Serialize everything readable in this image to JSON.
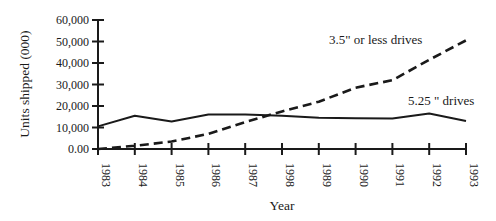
{
  "chart_data": {
    "type": "line",
    "title": "",
    "xlabel": "Year",
    "ylabel": "Units shipped (000)",
    "ylim": [
      0,
      60000
    ],
    "grid": false,
    "legend_position": "inline annotations",
    "x": [
      "1983",
      "1984",
      "1985",
      "1986",
      "1987",
      "1998",
      "1989",
      "1990",
      "1991",
      "1992",
      "1993"
    ],
    "y_ticks": [
      "0.00",
      "10,000",
      "20,000",
      "30,000",
      "40,000",
      "50,000",
      "60,000"
    ],
    "y_tick_values": [
      0,
      10000,
      20000,
      30000,
      40000,
      50000,
      60000
    ],
    "series": [
      {
        "name": "3.5\" or less drives",
        "style": "dashed",
        "color": "#1a1a1a",
        "values": [
          0,
          1500,
          3500,
          7000,
          12500,
          17500,
          22000,
          28500,
          32000,
          41500,
          50500
        ]
      },
      {
        "name": "5.25 \" drives",
        "style": "solid",
        "color": "#1a1a1a",
        "values": [
          10500,
          15500,
          12800,
          16000,
          16000,
          15500,
          14500,
          14300,
          14200,
          16500,
          13000
        ]
      }
    ],
    "annotations": [
      {
        "text": "3.5\" or less drives",
        "series": 0
      },
      {
        "text": "5.25 \" drives",
        "series": 1
      }
    ]
  }
}
